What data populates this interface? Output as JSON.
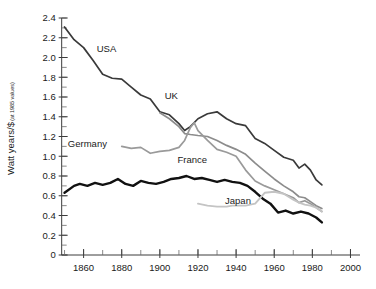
{
  "chart_data": {
    "type": "line",
    "title": "",
    "subtitle": "",
    "xlabel": "",
    "ylabel": "Watt years/$",
    "ylabel_sub": "(at 1985 values)",
    "xlim": [
      1845,
      2005
    ],
    "ylim": [
      0,
      2.4
    ],
    "grid": false,
    "legend_position": "inline-annotations",
    "x_ticks": [
      1860,
      1880,
      1900,
      1920,
      1940,
      1960,
      1980,
      2000
    ],
    "x_tick_labels": [
      "1860",
      "1880",
      "1900",
      "1920",
      "1940",
      "1960",
      "1980",
      "2000"
    ],
    "x_minor_step": 10,
    "y_ticks": [
      0,
      0.2,
      0.4,
      0.6,
      0.8,
      1.0,
      1.2,
      1.4,
      1.6,
      1.8,
      2.0,
      2.2,
      2.4
    ],
    "y_tick_labels": [
      "0",
      "0.2",
      "0.4",
      "0.6",
      "0.8",
      "1.0",
      "1.2",
      "1.4",
      "1.6",
      "1.8",
      "2.0",
      "2.2",
      "2.4"
    ],
    "y_minor_step": 0.1,
    "series": [
      {
        "name": "USA",
        "color": "#3a3a3a",
        "width": 1.7,
        "label_x": 1872,
        "label_y": 2.06,
        "x": [
          1850,
          1855,
          1860,
          1865,
          1870,
          1875,
          1880,
          1885,
          1890,
          1895,
          1900,
          1905,
          1910,
          1913,
          1916,
          1920,
          1925,
          1930,
          1935,
          1940,
          1945,
          1950,
          1955,
          1960,
          1965,
          1970,
          1973,
          1976,
          1979,
          1982,
          1985
        ],
        "y": [
          2.31,
          2.18,
          2.1,
          1.97,
          1.83,
          1.79,
          1.78,
          1.7,
          1.62,
          1.58,
          1.45,
          1.42,
          1.33,
          1.26,
          1.3,
          1.38,
          1.43,
          1.45,
          1.38,
          1.33,
          1.31,
          1.18,
          1.13,
          1.06,
          0.99,
          0.96,
          0.88,
          0.92,
          0.86,
          0.76,
          0.71
        ]
      },
      {
        "name": "UK",
        "color": "#8c8c8c",
        "width": 1.7,
        "label_x": 1906,
        "label_y": 1.58,
        "x": [
          1900,
          1905,
          1910,
          1913,
          1916,
          1920,
          1925,
          1930,
          1935,
          1940,
          1945,
          1950,
          1955,
          1960,
          1965,
          1970,
          1973,
          1976,
          1979,
          1982,
          1985
        ],
        "y": [
          1.44,
          1.38,
          1.3,
          1.23,
          1.22,
          1.21,
          1.2,
          1.16,
          1.11,
          1.07,
          1.02,
          0.93,
          0.85,
          0.77,
          0.7,
          0.64,
          0.59,
          0.58,
          0.54,
          0.5,
          0.47
        ]
      },
      {
        "name": "Germany",
        "color": "#9a9a9a",
        "width": 1.7,
        "label_x": 1862,
        "label_y": 1.09,
        "x": [
          1880,
          1885,
          1890,
          1895,
          1900,
          1905,
          1910,
          1913,
          1916,
          1918,
          1920,
          1925,
          1930,
          1935,
          1940,
          1945,
          1950,
          1955,
          1960,
          1965,
          1970,
          1973,
          1976,
          1979,
          1982,
          1985
        ],
        "y": [
          1.1,
          1.08,
          1.09,
          1.03,
          1.05,
          1.06,
          1.09,
          1.16,
          1.29,
          1.34,
          1.26,
          1.16,
          1.07,
          1.04,
          1.0,
          0.86,
          0.75,
          0.7,
          0.66,
          0.62,
          0.58,
          0.53,
          0.55,
          0.52,
          0.48,
          0.44
        ]
      },
      {
        "name": "France",
        "color": "#111111",
        "width": 2.4,
        "label_x": 1917,
        "label_y": 0.93,
        "x": [
          1850,
          1855,
          1858,
          1862,
          1866,
          1870,
          1874,
          1878,
          1882,
          1886,
          1890,
          1894,
          1898,
          1902,
          1906,
          1910,
          1914,
          1918,
          1922,
          1926,
          1930,
          1934,
          1938,
          1942,
          1946,
          1950,
          1954,
          1958,
          1962,
          1966,
          1970,
          1974,
          1978,
          1982,
          1985
        ],
        "y": [
          0.63,
          0.7,
          0.72,
          0.7,
          0.73,
          0.71,
          0.73,
          0.77,
          0.72,
          0.7,
          0.75,
          0.73,
          0.72,
          0.74,
          0.77,
          0.78,
          0.8,
          0.77,
          0.78,
          0.76,
          0.74,
          0.76,
          0.74,
          0.73,
          0.7,
          0.64,
          0.57,
          0.52,
          0.43,
          0.45,
          0.42,
          0.44,
          0.42,
          0.38,
          0.33
        ]
      },
      {
        "name": "Japan",
        "color": "#c4c4c4",
        "width": 1.9,
        "label_x": 1941,
        "label_y": 0.52,
        "x": [
          1920,
          1925,
          1930,
          1935,
          1938,
          1941,
          1945,
          1950,
          1955,
          1960,
          1965,
          1970,
          1973,
          1976,
          1979,
          1982,
          1985
        ],
        "y": [
          0.52,
          0.5,
          0.49,
          0.49,
          0.5,
          0.5,
          0.5,
          0.52,
          0.63,
          0.64,
          0.62,
          0.56,
          0.53,
          0.51,
          0.5,
          0.48,
          0.44
        ]
      }
    ]
  }
}
